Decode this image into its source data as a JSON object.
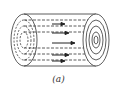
{
  "figure": {
    "caption": "(a)",
    "stroke_color": "#333333",
    "arrows": 6
  }
}
